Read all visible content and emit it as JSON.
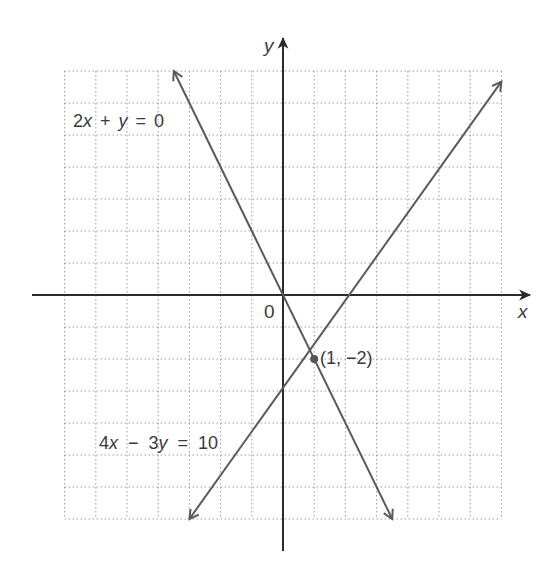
{
  "chart_data": {
    "type": "line",
    "title": "",
    "xlabel": "x",
    "ylabel": "y",
    "origin_label": "0",
    "xlim": [
      -7,
      7
    ],
    "ylim": [
      -7,
      7
    ],
    "grid": true,
    "series": [
      {
        "name": "2x + y = 0",
        "equation": "2x + y = 0",
        "slope": -2,
        "intercept": 0,
        "x": [
          -3.5,
          3.5
        ],
        "y": [
          7,
          -7
        ],
        "label_text": "2x + y = 0",
        "label_x_italic": "x",
        "label_y_italic": "y",
        "color": "#5a5a5a"
      },
      {
        "name": "4x - 3y = 10",
        "equation": "4x - 3y = 10",
        "slope": 1.3333,
        "intercept": -3.3333,
        "x": [
          -3,
          7
        ],
        "y": [
          -7,
          6.67
        ],
        "label_text": "4x − 3y = 10",
        "color": "#5a5a5a"
      }
    ],
    "annotations": [
      {
        "text": "(1, −2)",
        "x": 1,
        "y": -2,
        "type": "intersection-point"
      }
    ]
  },
  "labels": {
    "eq1": {
      "a": "2",
      "x": "x",
      "op": "+",
      "y": "y",
      "eq": "=",
      "rhs": "0"
    },
    "eq2": {
      "a": "4",
      "x": "x",
      "op": "−",
      "b": "3",
      "y": "y",
      "eq": "=",
      "rhs": "10"
    },
    "point": "(1, −2)",
    "origin": "0",
    "x_axis": "x",
    "y_axis": "y"
  }
}
